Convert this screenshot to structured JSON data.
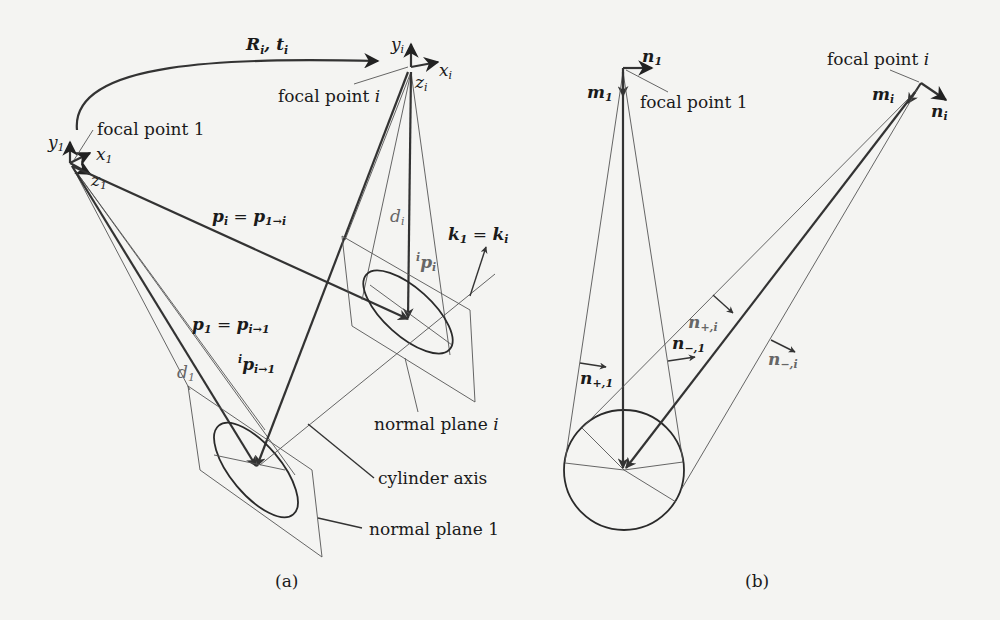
{
  "figure_a": {
    "caption": "(a)",
    "transform": {
      "base_R": "R",
      "base_t": "t",
      "sub": "i"
    },
    "focal_point_1": "focal point 1",
    "focal_point_i": "focal point i",
    "axes_1": {
      "x": "x",
      "y": "y",
      "z": "z",
      "sub": "1"
    },
    "axes_i": {
      "x": "x",
      "y": "y",
      "z": "z",
      "sub": "i"
    },
    "p_i_eq": {
      "lhs": "p",
      "lhs_sub": "i",
      "rhs": "p",
      "rhs_sub": "1→i"
    },
    "p_1_eq": {
      "lhs": "p",
      "lhs_sub": "1",
      "rhs": "p",
      "rhs_sub": "i→1"
    },
    "ip_i_to_1": {
      "pre": "i",
      "base": "p",
      "sub": "i→1"
    },
    "ip_i": {
      "pre": "i",
      "base": "p",
      "sub": "i"
    },
    "d_1": {
      "base": "d",
      "sub": "1"
    },
    "d_i": {
      "base": "d",
      "sub": "i"
    },
    "k_eq": {
      "lhs": "k",
      "lhs_sub": "1",
      "rhs": "k",
      "rhs_sub": "i"
    },
    "normal_plane_i": "normal plane i",
    "normal_plane_1": "normal plane 1",
    "cylinder_axis": "cylinder axis"
  },
  "figure_b": {
    "caption": "(b)",
    "focal_point_1": "focal point 1",
    "focal_point_i": "focal point i",
    "n_1": {
      "base": "n",
      "sub": "1"
    },
    "m_1": {
      "base": "m",
      "sub": "1"
    },
    "n_i": {
      "base": "n",
      "sub": "i"
    },
    "m_i": {
      "base": "m",
      "sub": "i"
    },
    "n_plus_1": {
      "base": "n",
      "sub": "+,1"
    },
    "n_minus_1": {
      "base": "n",
      "sub": "−,1"
    },
    "n_plus_i": {
      "base": "n",
      "sub": "+,i"
    },
    "n_minus_i": {
      "base": "n",
      "sub": "−,i"
    }
  }
}
